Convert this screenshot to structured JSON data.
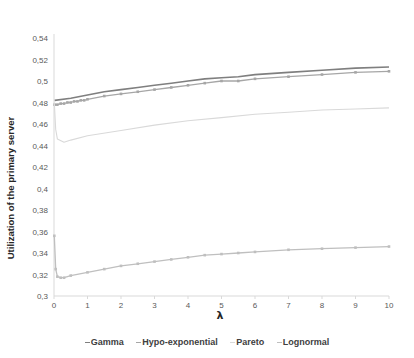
{
  "chart_data": {
    "type": "line",
    "title": "",
    "xlabel": "λ",
    "ylabel": "Utilization of the primary server",
    "xlim": [
      0,
      10
    ],
    "ylim": [
      0.3,
      0.54
    ],
    "x_ticks": [
      "0",
      "1",
      "2",
      "3",
      "4",
      "5",
      "6",
      "7",
      "8",
      "9",
      "10"
    ],
    "y_ticks": [
      "0,3",
      "0,32",
      "0,34",
      "0,36",
      "0,38",
      "0,4",
      "0,42",
      "0,44",
      "0,46",
      "0,48",
      "0,5",
      "0,52",
      "0,54"
    ],
    "grid": false,
    "legend_position": "bottom",
    "series": [
      {
        "name": "Gamma",
        "color": "#7f7f7f",
        "x": [
          0.02,
          0.5,
          1,
          1.5,
          2,
          2.5,
          3,
          3.5,
          4,
          4.5,
          5,
          5.5,
          6,
          7,
          8,
          9,
          10
        ],
        "values": [
          0.482,
          0.484,
          0.487,
          0.49,
          0.492,
          0.494,
          0.496,
          0.498,
          0.5,
          0.502,
          0.503,
          0.504,
          0.506,
          0.508,
          0.51,
          0.512,
          0.513
        ]
      },
      {
        "name": "Hypo-exponential",
        "color": "#a6a6a6",
        "x": [
          0.02,
          0.1,
          0.2,
          0.3,
          0.4,
          0.5,
          0.6,
          0.7,
          0.8,
          0.9,
          1,
          1.5,
          2,
          2.5,
          3,
          3.5,
          4,
          4.5,
          5,
          5.5,
          6,
          7,
          8,
          9,
          10
        ],
        "values": [
          0.478,
          0.478,
          0.479,
          0.479,
          0.48,
          0.48,
          0.481,
          0.481,
          0.482,
          0.482,
          0.483,
          0.486,
          0.488,
          0.49,
          0.492,
          0.494,
          0.496,
          0.498,
          0.5,
          0.5,
          0.502,
          0.504,
          0.506,
          0.508,
          0.509
        ]
      },
      {
        "name": "Pareto",
        "color": "#d9d9d9",
        "x": [
          0.01,
          0.05,
          0.1,
          0.3,
          0.5,
          1,
          2,
          3,
          4,
          5,
          6,
          7,
          8,
          9,
          10
        ],
        "values": [
          0.48,
          0.455,
          0.446,
          0.443,
          0.445,
          0.449,
          0.454,
          0.459,
          0.463,
          0.466,
          0.469,
          0.471,
          0.473,
          0.474,
          0.475
        ]
      },
      {
        "name": "Lognormal",
        "color": "#bfbfbf",
        "x": [
          0.01,
          0.05,
          0.1,
          0.2,
          0.3,
          0.5,
          1,
          1.5,
          2,
          2.5,
          3,
          3.5,
          4,
          4.5,
          5,
          5.5,
          6,
          7,
          8,
          9,
          10
        ],
        "values": [
          0.356,
          0.325,
          0.318,
          0.317,
          0.317,
          0.319,
          0.322,
          0.325,
          0.328,
          0.33,
          0.332,
          0.334,
          0.336,
          0.338,
          0.339,
          0.34,
          0.341,
          0.343,
          0.344,
          0.345,
          0.346
        ]
      }
    ]
  },
  "legend": {
    "items": [
      "Gamma",
      "Hypo-exponential",
      "Pareto",
      "Lognormal"
    ]
  }
}
